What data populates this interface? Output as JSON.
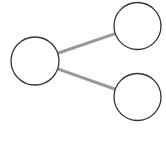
{
  "diagram": {
    "type": "tree",
    "colors": {
      "node_stroke": "#333333",
      "node_fill": "#ffffff",
      "edge": "#999999"
    },
    "nodes": [
      {
        "id": "root",
        "label": "",
        "cx": 35,
        "cy": 61,
        "r": 24
      },
      {
        "id": "child-top",
        "label": "",
        "cx": 137.5,
        "cy": 26,
        "r": 23.5
      },
      {
        "id": "child-bottom",
        "label": "",
        "cx": 137.5,
        "cy": 97,
        "r": 23.5
      }
    ],
    "edges": [
      {
        "from": "root",
        "to": "child-top"
      },
      {
        "from": "root",
        "to": "child-bottom"
      }
    ]
  }
}
